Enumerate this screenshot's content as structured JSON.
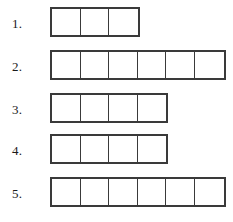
{
  "worksheet": {
    "background_color": "#ffffff",
    "border_color": "#3a3a3a",
    "cell_fill_color": "#ffffff",
    "label_color": "#1a1a1a",
    "rows": [
      {
        "label": "1.",
        "cell_count": 3,
        "cells": [
          "",
          "",
          ""
        ],
        "top": 7,
        "label_top": 17
      },
      {
        "label": "2.",
        "cell_count": 6,
        "cells": [
          "",
          "",
          "",
          "",
          "",
          ""
        ],
        "top": 50,
        "label_top": 60
      },
      {
        "label": "3.",
        "cell_count": 4,
        "cells": [
          "",
          "",
          "",
          ""
        ],
        "top": 93,
        "label_top": 103
      },
      {
        "label": "4.",
        "cell_count": 4,
        "cells": [
          "",
          "",
          "",
          ""
        ],
        "top": 134,
        "label_top": 144
      },
      {
        "label": "5.",
        "cell_count": 6,
        "cells": [
          "",
          "",
          "",
          "",
          "",
          ""
        ],
        "top": 177,
        "label_top": 187
      }
    ]
  }
}
